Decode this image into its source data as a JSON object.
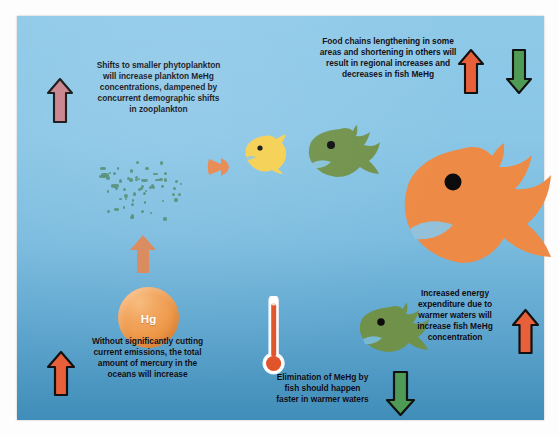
{
  "figure": {
    "background_color": "#8ac6e6",
    "panel_border_color": "#ffffff"
  },
  "captions": [
    {
      "id": "phytoplankton",
      "lines": [
        "Shifts to smaller phytoplankton",
        "will increase plankton MeHg",
        "concentrations, dampened by",
        "concurrent demographic shifts",
        "in zooplankton"
      ]
    },
    {
      "id": "food-chains",
      "lines": [
        "Food chains lengthening in some",
        "areas and shortening in others will",
        "result in regional increases and",
        "decreases in fish MeHg"
      ]
    },
    {
      "id": "emissions",
      "lines": [
        "Without significantly cutting",
        "current emissions, the total",
        "amount of mercury in the",
        "oceans will increase"
      ]
    },
    {
      "id": "elimination",
      "lines": [
        "Elimination of MeHg by",
        "fish should happen",
        "faster in warmer waters"
      ]
    },
    {
      "id": "energy-expenditure",
      "lines": [
        "Increased energy",
        "expenditure due to",
        "warmer waters will",
        "increase fish MeHg",
        "concentration"
      ]
    }
  ],
  "arrows": [
    {
      "id": "phytoplankton-up-arrow",
      "direction": "up",
      "color": "#c98089",
      "outline": "#111111",
      "meaning": "increase"
    },
    {
      "id": "food-chains-up-arrow",
      "direction": "up",
      "color": "#e8603a",
      "outline": "#111111",
      "meaning": "increase"
    },
    {
      "id": "food-chains-down-arrow",
      "direction": "down",
      "color": "#4f9b55",
      "outline": "#111111",
      "meaning": "decrease"
    },
    {
      "id": "mercury-flux-up-arrow",
      "direction": "up",
      "color": "#e0834f",
      "outline": "none",
      "meaning": "increase"
    },
    {
      "id": "emissions-up-arrow",
      "direction": "up",
      "color": "#e8603a",
      "outline": "#111111",
      "meaning": "increase"
    },
    {
      "id": "elimination-down-arrow",
      "direction": "down",
      "color": "#4f9b55",
      "outline": "#111111",
      "meaning": "decrease"
    },
    {
      "id": "energy-up-arrow",
      "direction": "up",
      "color": "#e8603a",
      "outline": "#111111",
      "meaning": "increase"
    }
  ],
  "organisms": [
    {
      "id": "plankton-cluster",
      "label": "plankton",
      "color": "#4e8a72",
      "count": 58,
      "trophic_level": 1
    },
    {
      "id": "small-orange-fish",
      "label": "small fish",
      "color": "#e8844a",
      "trophic_level": 2
    },
    {
      "id": "yellow-fish",
      "label": "medium fish",
      "color": "#f5cf4e",
      "trophic_level": 3
    },
    {
      "id": "green-fish-upper",
      "label": "large fish",
      "color": "#6f9149",
      "trophic_level": 4
    },
    {
      "id": "orange-fish-large",
      "label": "top predator fish",
      "color": "#ed8a45",
      "trophic_level": 5
    },
    {
      "id": "green-fish-lower",
      "label": "fish",
      "color": "#6f9149",
      "trophic_level": 4
    }
  ],
  "mercury_droplet": {
    "symbol": "Hg",
    "color": "#ee9543",
    "text_color": "#ffffff"
  },
  "thermometer": {
    "id": "thermometer",
    "fluid_color": "#e0542a",
    "casing_color": "#ffffff",
    "meaning": "warmer waters"
  }
}
